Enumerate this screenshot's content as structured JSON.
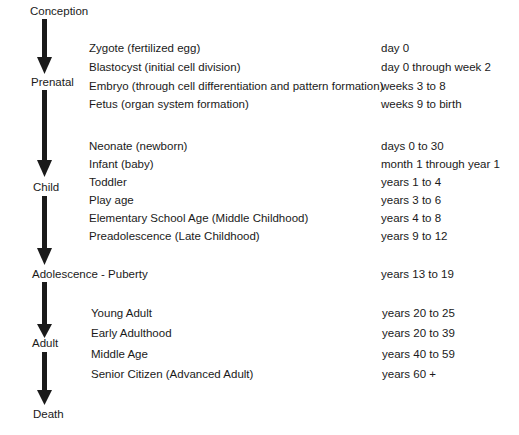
{
  "diagram": {
    "stages": [
      {
        "label": "Conception"
      },
      {
        "label": "Prenatal"
      },
      {
        "label": "Child"
      },
      {
        "label": "Adolescence - Puberty"
      },
      {
        "label": "Adult"
      },
      {
        "label": "Death"
      }
    ],
    "adolescence_range": "years 13 to 19",
    "groups": {
      "prenatal": [
        {
          "name": "Zygote (fertilized egg)",
          "range": "day 0"
        },
        {
          "name": "Blastocyst (initial cell division)",
          "range": "day 0 through week 2"
        },
        {
          "name": "Embryo (through cell differentiation and pattern formation)",
          "range": "weeks 3 to 8"
        },
        {
          "name": "Fetus (organ system formation)",
          "range": "weeks 9 to birth"
        }
      ],
      "child": [
        {
          "name": "Neonate (newborn)",
          "range": "days 0 to 30"
        },
        {
          "name": "Infant (baby)",
          "range": "month 1 through year 1"
        },
        {
          "name": "Toddler",
          "range": "years 1 to 4"
        },
        {
          "name": "Play age",
          "range": "years 3 to 6"
        },
        {
          "name": "Elementary School Age (Middle Childhood)",
          "range": "years 4 to 8"
        },
        {
          "name": "Preadolescence (Late Childhood)",
          "range": "years 9 to 12"
        }
      ],
      "adult": [
        {
          "name": "Young Adult",
          "range": "years 20 to 25"
        },
        {
          "name": "Early Adulthood",
          "range": "years 20 to 39"
        },
        {
          "name": "Middle Age",
          "range": "years 40 to 59"
        },
        {
          "name": "Senior Citizen (Advanced Adult)",
          "range": "years 60 +"
        }
      ]
    },
    "colors": {
      "ink": "#1a1a1a",
      "background": "#ffffff"
    }
  }
}
